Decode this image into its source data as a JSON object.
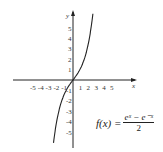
{
  "chart_data": {
    "type": "line",
    "title": "",
    "xlabel": "x",
    "ylabel": "y",
    "x_ticks": [
      -5,
      -4,
      -3,
      -2,
      -1,
      1,
      2,
      3,
      4,
      5
    ],
    "y_ticks": [
      5,
      4,
      3,
      2,
      1,
      -1,
      -2,
      -3,
      -4,
      -5
    ],
    "xlim": [
      -5.5,
      5.5
    ],
    "ylim": [
      -6,
      6
    ],
    "grid": false,
    "series": [
      {
        "name": "f(x) = (e^x - e^-x)/2",
        "function": "sinh",
        "x": [
          -2.5,
          -2,
          -1.5,
          -1,
          -0.5,
          0,
          0.5,
          1,
          1.5,
          2,
          2.5
        ],
        "y": [
          -6.05,
          -3.63,
          -2.13,
          -1.18,
          -0.52,
          0,
          0.52,
          1.18,
          2.13,
          3.63,
          6.05
        ]
      }
    ],
    "annotation": "f(x) = (e^x − e^−x)/2"
  },
  "formula": {
    "lhs": "f(x) =",
    "numerator": "eˣ − e⁻ˣ",
    "denominator": "2"
  },
  "axes": {
    "x_label": "x",
    "y_label": "y"
  }
}
